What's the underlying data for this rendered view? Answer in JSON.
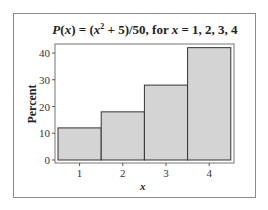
{
  "chart_data": {
    "type": "bar",
    "title_parts": {
      "p": "P",
      "x_arg": "x",
      "mid1": ") = (",
      "x_sq": "x",
      "sup": "2",
      "mid2": " + 5)/50, for ",
      "x_var": "x",
      "tail": " = 1, 2, 3, 4"
    },
    "categories": [
      "1",
      "2",
      "3",
      "4"
    ],
    "values": [
      12,
      18,
      28,
      42
    ],
    "xlabel": "x",
    "ylabel": "Percent",
    "ylim": [
      0,
      44
    ],
    "yticks": [
      0,
      10,
      20,
      30,
      40
    ],
    "grid": false,
    "legend": null,
    "bar_fill": "#d4d4d4",
    "bar_edge": "#333333"
  }
}
